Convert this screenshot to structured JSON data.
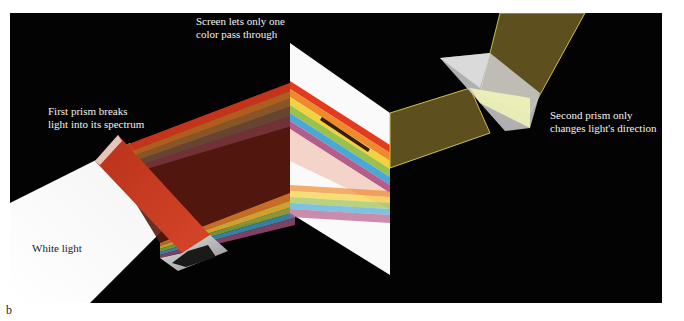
{
  "figure": {
    "panel_letter": "b",
    "labels": {
      "screen": [
        "Screen lets only one",
        "color pass through"
      ],
      "first_prism": [
        "First prism breaks",
        "light into its spectrum"
      ],
      "second_prism": [
        "Second prism only",
        "changes light's direction"
      ],
      "white_light": "White light"
    },
    "colors": {
      "background": "#030303",
      "white_beam": "#ffffff",
      "spectrum": [
        "#e23b1f",
        "#ef8a2c",
        "#f4d23f",
        "#9cc14a",
        "#49a8d6",
        "#b45d8a"
      ],
      "passed_beam": "#6b5a22",
      "passed_beam_edge": "#c9c24a"
    }
  }
}
